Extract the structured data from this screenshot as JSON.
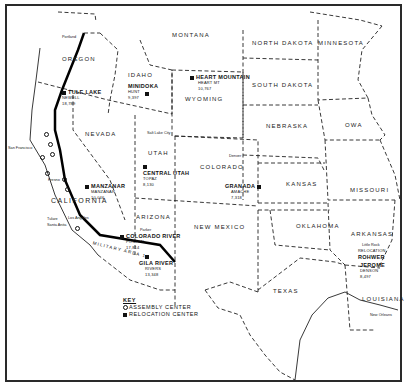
{
  "map": {
    "title": "",
    "states": [
      {
        "name": "Oregon",
        "label": "OREGON"
      },
      {
        "name": "Idaho",
        "label": "IDAHO"
      },
      {
        "name": "Montana",
        "label": "MONTANA"
      },
      {
        "name": "North Dakota",
        "label": "NORTH DAKOTA"
      },
      {
        "name": "Minnesota",
        "label": "MINNESOTA"
      },
      {
        "name": "South Dakota",
        "label": "SOUTH DAKOTA"
      },
      {
        "name": "Wyoming",
        "label": "WYOMING"
      },
      {
        "name": "Nevada",
        "label": "NEVADA"
      },
      {
        "name": "Utah",
        "label": "UTAH"
      },
      {
        "name": "Nebraska",
        "label": "NEBRASKA"
      },
      {
        "name": "Iowa",
        "label": "OWA"
      },
      {
        "name": "Colorado",
        "label": "COLORADO"
      },
      {
        "name": "Kansas",
        "label": "KANSAS"
      },
      {
        "name": "Missouri",
        "label": "MISSOURI"
      },
      {
        "name": "California",
        "label": "CALIFORNIA"
      },
      {
        "name": "Arizona",
        "label": "ARIZONA"
      },
      {
        "name": "New Mexico",
        "label": "NEW MEXICO"
      },
      {
        "name": "Oklahoma",
        "label": "OKLAHOMA"
      },
      {
        "name": "Arkansas",
        "label": "ARKANSAS"
      },
      {
        "name": "Texas",
        "label": "TEXAS"
      },
      {
        "name": "Louisiana",
        "label": "LOUISIANA"
      }
    ],
    "relocation_centers": [
      {
        "name": "TULE LAKE",
        "detail": "NEWELL",
        "pop": "18,789"
      },
      {
        "name": "MINIDOKA",
        "detail": "HUNT",
        "pop": "9,397"
      },
      {
        "name": "HEART MOUNTAIN",
        "detail": "HEART MT",
        "pop": "10,767"
      },
      {
        "name": "MANZANAR",
        "detail": "MANZANAR",
        "pop": "10,046"
      },
      {
        "name": "CENTRAL UTAH",
        "detail": "TOPAZ",
        "pop": "8,130"
      },
      {
        "name": "GRANADA",
        "detail": "AMACHE",
        "pop": "7,318"
      },
      {
        "name": "COLORADO RIVER",
        "detail": "POSTON",
        "pop": "17,814"
      },
      {
        "name": "GILA RIVER",
        "detail": "RIVERS",
        "pop": "13,348"
      },
      {
        "name": "ROHWER",
        "detail": "RELOCATION",
        "pop": ""
      },
      {
        "name": "JEROME",
        "detail": "DENSON",
        "pop": "8,497"
      }
    ],
    "cities": [
      "Salt Lake City",
      "Denver",
      "San Francisco",
      "Los Angeles",
      "Little Rock",
      "New Orleans",
      "Portland",
      "Tulare",
      "Santa Anita",
      "Fresno",
      "Parker"
    ],
    "other_labels": {
      "military_area": "MILITARY AREA 1"
    },
    "key": {
      "title": "KEY",
      "items": [
        {
          "symbol": "circle",
          "label": "ASSEMBLY CENTER"
        },
        {
          "symbol": "square",
          "label": "RELOCATION CENTER"
        }
      ]
    }
  }
}
